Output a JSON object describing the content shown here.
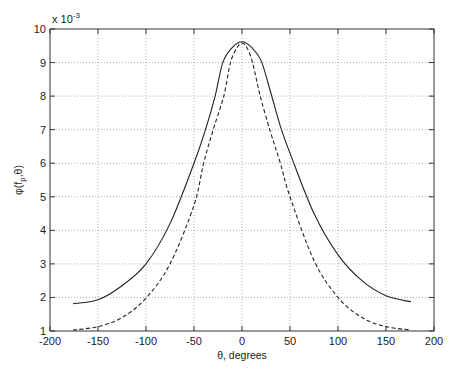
{
  "chart_data": {
    "type": "line",
    "title": "",
    "xlabel": "θ, degrees",
    "ylabel": "φ(f_p,θ)",
    "y_scale_label": "x 10",
    "y_scale_exponent": "-3",
    "xlim": [
      -200,
      200
    ],
    "ylim": [
      1,
      10
    ],
    "y_multiplier": 0.001,
    "grid": true,
    "legend": null,
    "x_ticks": [
      -200,
      -150,
      -100,
      -50,
      0,
      50,
      100,
      150,
      200
    ],
    "y_ticks": [
      1,
      2,
      3,
      4,
      5,
      6,
      7,
      8,
      9,
      10
    ],
    "series": [
      {
        "name": "solid",
        "style": "solid",
        "color": "#222222",
        "x": [
          -176,
          -150,
          -125,
          -100,
          -75,
          -50,
          -38,
          -28,
          -20,
          -10,
          0,
          10,
          20,
          30,
          40,
          50,
          75,
          100,
          125,
          150,
          176
        ],
        "values": [
          1.81,
          1.93,
          2.35,
          3.0,
          4.2,
          6.0,
          7.0,
          8.0,
          9.0,
          9.45,
          9.62,
          9.45,
          9.05,
          8.1,
          7.1,
          6.3,
          4.5,
          3.27,
          2.5,
          2.05,
          1.87
        ]
      },
      {
        "name": "dashed",
        "style": "dashed",
        "color": "#222222",
        "x": [
          -176,
          -150,
          -125,
          -100,
          -75,
          -50,
          -40,
          -30,
          -19,
          -12,
          -5,
          0,
          5,
          11,
          19,
          30,
          40,
          50,
          75,
          100,
          125,
          150,
          176
        ],
        "values": [
          1.03,
          1.13,
          1.4,
          1.98,
          3.0,
          4.75,
          6.0,
          7.0,
          8.0,
          9.0,
          9.45,
          9.58,
          9.45,
          9.0,
          8.0,
          6.9,
          6.0,
          5.0,
          3.1,
          2.0,
          1.4,
          1.13,
          1.03
        ]
      }
    ]
  },
  "layout": {
    "plot_left": 50,
    "plot_right": 434,
    "plot_top": 29,
    "plot_bottom": 331,
    "grid_color": "#9a9a9a",
    "axis_color": "#333333"
  }
}
